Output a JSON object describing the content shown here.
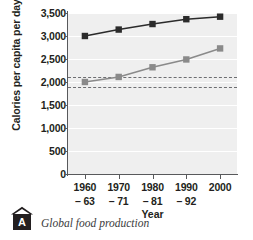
{
  "figure": {
    "caption_letter": "A",
    "caption_text": "Global food production",
    "badge_icon": "chevron-roof-icon"
  },
  "chart_data": {
    "type": "line",
    "title": "",
    "xlabel": "Year",
    "ylabel": "Calories per capita per day",
    "categories": [
      "1960–63",
      "1970–71",
      "1980–81",
      "1990–92",
      "2000"
    ],
    "category_lines": [
      [
        "1960",
        "– 63"
      ],
      [
        "1970",
        "– 71"
      ],
      [
        "1980",
        "– 81"
      ],
      [
        "1990",
        "– 92"
      ],
      [
        "2000",
        ""
      ]
    ],
    "ylim": [
      0,
      3500
    ],
    "yticks": [
      0,
      500,
      1000,
      1500,
      2000,
      2500,
      3000,
      3500
    ],
    "ytick_labels": [
      "0",
      "500",
      "1,000",
      "1,500",
      "2,000",
      "2,500",
      "3,000",
      "3,500"
    ],
    "grid": true,
    "legend": "none",
    "series": [
      {
        "name": "upper-line",
        "color": "#2b2b2b",
        "marker": "square",
        "values": [
          3000,
          3140,
          3260,
          3365,
          3420
        ]
      },
      {
        "name": "lower-line",
        "color": "#8a8a8a",
        "marker": "square",
        "values": [
          2000,
          2110,
          2320,
          2490,
          2730
        ]
      }
    ],
    "reference_lines": [
      {
        "name": "upper-dashed-threshold",
        "value": 2100,
        "style": "dashed",
        "color": "#6d6e71"
      },
      {
        "name": "lower-dashed-threshold",
        "value": 1900,
        "style": "dashed",
        "color": "#6d6e71"
      }
    ]
  }
}
